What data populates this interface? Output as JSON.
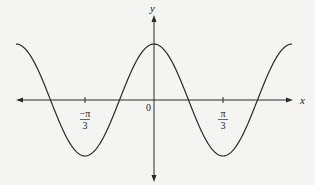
{
  "chart_data": {
    "type": "line",
    "title": "",
    "function": "cos(3x)",
    "xlabel": "x",
    "ylabel": "y",
    "origin_label": "0",
    "xlim": [
      -2.1,
      2.1
    ],
    "ylim": [
      -1.25,
      1.35
    ],
    "curve_domain": [
      -2.094,
      2.094
    ],
    "amplitude": 1,
    "angular_frequency": 3,
    "grid": false,
    "ticks": [
      {
        "value": -1.0472,
        "numerator": "−π",
        "denominator": "3"
      },
      {
        "value": 1.0472,
        "numerator": "π",
        "denominator": "3"
      }
    ],
    "colors": {
      "curve": "#2a2a2a",
      "axes": "#2a2a2a",
      "background": "#f4f4f2"
    }
  }
}
